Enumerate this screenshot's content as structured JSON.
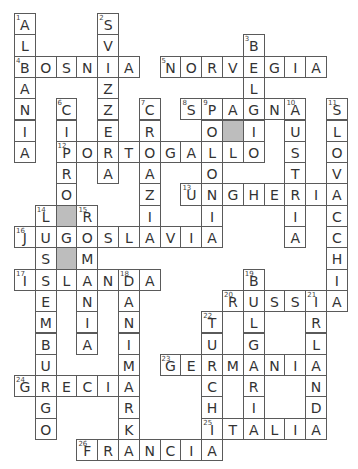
{
  "puzzle": {
    "type": "crossword",
    "cols": 16,
    "rows": 21,
    "colors": {
      "cell_bg": "#ffffff",
      "shaded_bg": "#bdbdbd",
      "border": "#5a5a5a",
      "text": "#333333"
    },
    "shaded_cells": [
      [
        5,
        10
      ],
      [
        9,
        2
      ],
      [
        11,
        2
      ]
    ],
    "words": [
      {
        "num": 1,
        "dir": "down",
        "row": 0,
        "col": 0,
        "answer": "ALBANIA"
      },
      {
        "num": 2,
        "dir": "down",
        "row": 0,
        "col": 4,
        "answer": "SVIZZERA"
      },
      {
        "num": 3,
        "dir": "down",
        "row": 1,
        "col": 11,
        "answer": "BELGIO"
      },
      {
        "num": 4,
        "dir": "across",
        "row": 2,
        "col": 0,
        "answer": "BOSNIA"
      },
      {
        "num": 5,
        "dir": "across",
        "row": 2,
        "col": 7,
        "answer": "NORVEGIA"
      },
      {
        "num": 6,
        "dir": "down",
        "row": 4,
        "col": 2,
        "answer": "CIPRO"
      },
      {
        "num": 7,
        "dir": "down",
        "row": 4,
        "col": 6,
        "answer": "CROAZIA"
      },
      {
        "num": 8,
        "dir": "across",
        "row": 4,
        "col": 8,
        "answer": "SPAGNA"
      },
      {
        "num": 9,
        "dir": "down",
        "row": 4,
        "col": 9,
        "answer": "POLONIA"
      },
      {
        "num": 10,
        "dir": "down",
        "row": 4,
        "col": 13,
        "answer": "AUSTRIA"
      },
      {
        "num": 11,
        "dir": "down",
        "row": 4,
        "col": 15,
        "answer": "SLOVACCHIA"
      },
      {
        "num": 12,
        "dir": "across",
        "row": 6,
        "col": 2,
        "answer": "PORTOGALLO"
      },
      {
        "num": 13,
        "dir": "across",
        "row": 8,
        "col": 8,
        "answer": "UNGHERIA"
      },
      {
        "num": 14,
        "dir": "down",
        "row": 9,
        "col": 1,
        "answer": "LUSSEMBURGO"
      },
      {
        "num": 15,
        "dir": "down",
        "row": 9,
        "col": 3,
        "answer": "ROMANIA"
      },
      {
        "num": 16,
        "dir": "across",
        "row": 10,
        "col": 0,
        "answer": "JUGOSLAVIA"
      },
      {
        "num": 17,
        "dir": "across",
        "row": 12,
        "col": 0,
        "answer": "ISLANDA"
      },
      {
        "num": 18,
        "dir": "down",
        "row": 12,
        "col": 5,
        "answer": "DANIMARKA"
      },
      {
        "num": 19,
        "dir": "down",
        "row": 12,
        "col": 11,
        "answer": "BULGARIA"
      },
      {
        "num": 20,
        "dir": "across",
        "row": 13,
        "col": 10,
        "answer": "RUSSIA"
      },
      {
        "num": 21,
        "dir": "down",
        "row": 13,
        "col": 14,
        "answer": "IRLANDA"
      },
      {
        "num": 22,
        "dir": "down",
        "row": 14,
        "col": 9,
        "answer": "TURCHIA"
      },
      {
        "num": 23,
        "dir": "across",
        "row": 16,
        "col": 7,
        "answer": "GERMANIA"
      },
      {
        "num": 24,
        "dir": "across",
        "row": 17,
        "col": 0,
        "answer": "GRECIA"
      },
      {
        "num": 25,
        "dir": "across",
        "row": 19,
        "col": 9,
        "answer": "ITALIA"
      },
      {
        "num": 26,
        "dir": "across",
        "row": 20,
        "col": 3,
        "answer": "FRANCIA"
      }
    ],
    "grid_rows": [
      "A___S___________",
      "A___V______B____",
      "BOSNIA_NORVEGIA_",
      "A___Z______L____",
      "N_C_Z_C_SPAGNA_S",
      "I_I_E_R__O#I_U_L",
      "A_PORTOGALLO_S_O",
      "__R_A_A__O___T_V",
      "__O___Z_UNGHERIA",
      "_L#R__I__I___I_C",
      "JUGOSLAVIA___A_C",
      "_S#M___________H",
      "ISLANDA____B___I",
      "_S_A_A____RUSSIA",
      "_E_N_N___T_L__R_",
      "_M_I_I___U_G__L_",
      "_B_A_M_GERMANIA_",
      "GRECIA___C_R__N_",
      "_G___R___H_I__D_",
      "_O___K___ITALIA_",
      "___FRANCIA______"
    ]
  }
}
